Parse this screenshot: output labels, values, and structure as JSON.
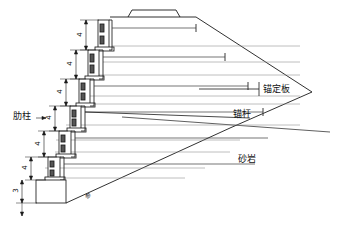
{
  "figure": {
    "background_color": "#ffffff",
    "line_color": "#1a1a1a",
    "thin_line_color": "#6b6b6b",
    "text_color": "#111111"
  },
  "labels": {
    "rib_column": "肋柱",
    "anchor_plate": "锚定板",
    "anchor_rod": "锚杆",
    "sandstone": "砂岩",
    "slope_note": "参"
  },
  "dimensions": {
    "tier_heights": [
      "4",
      "4",
      "4",
      "4",
      "4",
      "4"
    ],
    "footing_height": "3",
    "unit_note": ""
  },
  "structure": {
    "tier_count": 6,
    "tiers": [
      {
        "index": 1,
        "dim": "4",
        "col_x": 98,
        "top_y": 20,
        "bottom_y": 50,
        "rod_y": 28,
        "rod_end_x": 196
      },
      {
        "index": 2,
        "dim": "4",
        "col_x": 88,
        "top_y": 50,
        "bottom_y": 79,
        "rod_y": 57,
        "rod_end_x": 225
      },
      {
        "index": 3,
        "dim": "4",
        "col_x": 79,
        "top_y": 79,
        "bottom_y": 106,
        "rod_y": 86,
        "rod_end_x": 248
      },
      {
        "index": 4,
        "dim": "4",
        "col_x": 70,
        "top_y": 106,
        "bottom_y": 131,
        "rod_y": 112,
        "rod_end_x": 263
      },
      {
        "index": 5,
        "dim": "4",
        "col_x": 59,
        "top_y": 131,
        "bottom_y": 157,
        "rod_y": 138,
        "rod_end_x": 268
      },
      {
        "index": 6,
        "dim": "4",
        "col_x": 48,
        "top_y": 157,
        "bottom_y": 180,
        "rod_y": 164,
        "rod_end_x": 255
      }
    ],
    "footing": {
      "x": 36,
      "y": 180,
      "width": 30,
      "height": 23,
      "dim": "3"
    },
    "parapet": {
      "x": 128,
      "y": 10,
      "width": 54,
      "height": 7
    }
  },
  "strata": {
    "name": "砂岩",
    "layer_lines": 7
  },
  "leaders": {
    "anchor_plate_target": "锚定板",
    "anchor_rod_target": "锚杆",
    "sandstone_target": "砂岩"
  }
}
